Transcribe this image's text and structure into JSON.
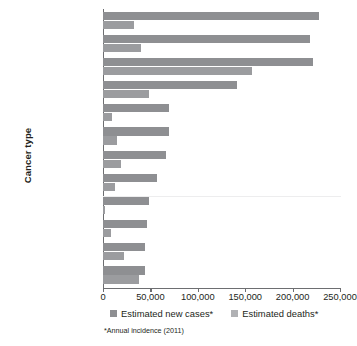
{
  "chart_data": {
    "type": "bar",
    "orientation": "horizontal",
    "title": "",
    "xlabel": "",
    "ylabel": "Cancer type",
    "xlim": [
      0,
      250000
    ],
    "xticks": [
      0,
      50000,
      100000,
      150000,
      200000,
      250000
    ],
    "xtick_labels": [
      "0",
      "50,000",
      "100,000",
      "150,000",
      "200,000",
      "250,000"
    ],
    "grid": false,
    "legend_position": "bottom",
    "categories": [
      "Prostate",
      "Breast (female)",
      "Lung",
      "Colon & rectal",
      "Melanoma",
      "Bladder",
      "Non-Hodgkin\nlymphoma",
      "Renal cell",
      "Thyroid",
      "Endometrial",
      "Leukemia",
      "Pancreatic"
    ],
    "series": [
      {
        "name": "Estimated new cases*",
        "color": "#8e8f92",
        "values": [
          228000,
          218000,
          221000,
          141000,
          70000,
          70000,
          66000,
          57000,
          48000,
          46000,
          44000,
          44000
        ]
      },
      {
        "name": "Estimated deaths*",
        "color": "#9b9c9f",
        "values": [
          33000,
          40000,
          157000,
          49000,
          9000,
          15000,
          19000,
          13000,
          1700,
          8000,
          22000,
          38000
        ]
      }
    ],
    "footnote": "*Annual incidence (2011)"
  },
  "legend": {
    "items": [
      {
        "label": "Estimated new cases*"
      },
      {
        "label": "Estimated deaths*"
      }
    ]
  },
  "axes": {
    "y_title": "Cancer type"
  },
  "colors": {
    "cases": "#8e8f92",
    "deaths": "#9b9c9f",
    "axis": "#6d6e71",
    "text": "#231f20"
  }
}
